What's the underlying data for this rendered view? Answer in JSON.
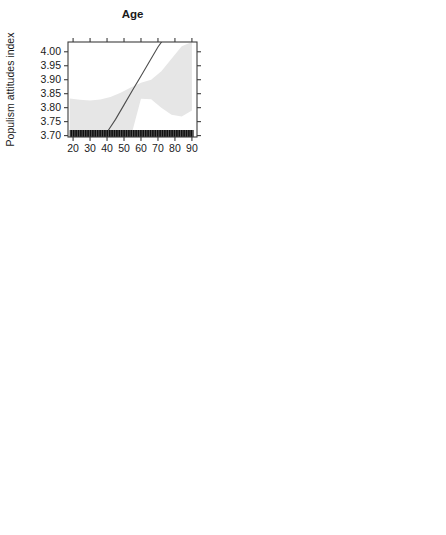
{
  "figure": {
    "ylabel": "Populism attitudes index",
    "y_ticks": [
      "4.00",
      "3.95",
      "3.90",
      "3.85",
      "3.80",
      "3.75",
      "3.70"
    ],
    "ylim": [
      3.695,
      4.035
    ],
    "band_color": "#e6e6e6",
    "line_color": "#4d4d4d",
    "rug_color": "#111111",
    "axis_color": "#3c3c3c"
  },
  "chart_data": [
    {
      "type": "line",
      "panel": 1,
      "title": "Age",
      "xlabel": "",
      "ylabel": "Populism attitudes index",
      "x_ticks": [
        "20",
        "30",
        "40",
        "50",
        "60",
        "70",
        "80",
        "90"
      ],
      "x_tick_values": [
        20,
        30,
        40,
        50,
        60,
        70,
        80,
        90
      ],
      "xlim": [
        17,
        93
      ],
      "ylim": [
        3.695,
        4.035
      ],
      "grid": false,
      "legend": "none",
      "series": [
        {
          "name": "Predicted populism attitudes",
          "x": [
            18,
            25,
            30,
            35,
            40,
            45,
            50,
            55,
            60,
            65,
            70,
            75
          ],
          "values": [
            3.6,
            3.635,
            3.66,
            3.685,
            3.712,
            3.758,
            3.81,
            3.862,
            3.913,
            3.965,
            4.017,
            4.06
          ]
        }
      ],
      "ci_upper": {
        "x": [
          18,
          24,
          30,
          36,
          42,
          48,
          54,
          60,
          66,
          72,
          78,
          84,
          90
        ],
        "values": [
          3.833,
          3.828,
          3.826,
          3.829,
          3.838,
          3.853,
          3.872,
          3.889,
          3.9,
          3.93,
          3.975,
          4.02,
          4.035
        ]
      },
      "ci_lower": {
        "x": [
          18,
          24,
          30,
          36,
          42,
          48,
          54,
          60,
          66,
          72,
          78,
          84,
          90
        ],
        "values": [
          3.695,
          3.695,
          3.695,
          3.695,
          3.695,
          3.695,
          3.695,
          3.832,
          3.83,
          3.8,
          3.775,
          3.768,
          3.79
        ]
      },
      "rug": {
        "type": "dense",
        "x_range": [
          18,
          91
        ],
        "description": "dense continuous rug of observations along bottom axis"
      }
    },
    {
      "type": "scatter",
      "panel": 2,
      "title": "Ideological self-placement",
      "xlabel": "",
      "ylabel": "Populism attitudes index",
      "categories": [
        "Centrist",
        "Moderate",
        "Extremist"
      ],
      "values": [
        3.804,
        3.807,
        3.894
      ],
      "ci_lower": [
        3.756,
        3.759,
        3.831
      ],
      "ci_upper": [
        3.852,
        3.855,
        3.956
      ],
      "ylim": [
        3.695,
        4.035
      ],
      "grid": false,
      "legend": "none"
    },
    {
      "type": "line",
      "panel": 3,
      "title": "Interest in politics",
      "xlabel": "",
      "ylabel": "Populism attitudes index",
      "x_ticks": [
        "1.0",
        "1.5",
        "2.0",
        "2.5",
        "3.0",
        "3.5",
        "4.0"
      ],
      "x_tick_values": [
        1.0,
        1.5,
        2.0,
        2.5,
        3.0,
        3.5,
        4.0
      ],
      "xlim": [
        0.9,
        4.1
      ],
      "ylim": [
        3.695,
        4.035
      ],
      "grid": false,
      "legend": "none",
      "series": [
        {
          "name": "Predicted populism attitudes",
          "x": [
            1.0,
            4.0
          ],
          "values": [
            3.767,
            3.889
          ]
        }
      ],
      "ci_upper": {
        "x": [
          1.0,
          2.0,
          3.0,
          4.0
        ],
        "values": [
          3.801,
          3.834,
          3.879,
          3.936
        ]
      },
      "ci_lower": {
        "x": [
          1.0,
          2.0,
          3.0,
          4.0
        ],
        "values": [
          3.733,
          3.777,
          3.815,
          3.845
        ]
      },
      "rug": {
        "type": "blocks",
        "x_values": [
          1.0,
          2.0,
          3.0,
          4.0
        ]
      }
    },
    {
      "type": "line",
      "panel": 4,
      "title": "Government appraisal",
      "xlabel": "",
      "ylabel": "Populism attitudes index",
      "x_ticks": [
        "1.0",
        "1.5",
        "2.0",
        "2.5",
        "3.0",
        "3.5",
        "4.0"
      ],
      "x_tick_values": [
        1.0,
        1.5,
        2.0,
        2.5,
        3.0,
        3.5,
        4.0
      ],
      "xlim": [
        0.9,
        4.1
      ],
      "ylim": [
        3.695,
        4.035
      ],
      "grid": false,
      "legend": "none",
      "series": [
        {
          "name": "Predicted populism attitudes",
          "x": [
            1.0,
            4.0
          ],
          "values": [
            3.938,
            3.714
          ]
        }
      ],
      "ci_upper": {
        "x": [
          1.0,
          2.0,
          3.0,
          4.0
        ],
        "values": [
          4.001,
          3.905,
          3.826,
          3.766
        ]
      },
      "ci_lower": {
        "x": [
          1.0,
          2.0,
          3.0,
          4.0
        ],
        "values": [
          3.878,
          3.83,
          3.762,
          3.695
        ]
      },
      "rug": {
        "type": "blocks",
        "x_values": [
          1.0,
          2.0,
          3.0,
          4.0
        ]
      }
    },
    {
      "type": "scatter",
      "panel": 5,
      "title": "Identifies with a party",
      "xlabel": "",
      "ylabel": "Populism attitudes index",
      "categories": [
        "no",
        "yes"
      ],
      "values": [
        3.858,
        3.787
      ],
      "ci_lower": [
        3.823,
        3.748
      ],
      "ci_upper": [
        3.895,
        3.822
      ],
      "ylim": [
        3.695,
        4.035
      ],
      "grid": false,
      "legend": "none"
    },
    {
      "type": "line",
      "panel": 6,
      "title": "Satisfaction with EU democracy",
      "xlabel": "",
      "ylabel": "Populism attitudes index",
      "x_ticks": [
        "1.0",
        "1.5",
        "2.0",
        "2.5",
        "3.0",
        "3.5",
        "4.0"
      ],
      "x_tick_values": [
        1.0,
        1.5,
        2.0,
        2.5,
        3.0,
        3.5,
        4.0
      ],
      "xlim": [
        0.9,
        4.1
      ],
      "ylim": [
        3.695,
        4.035
      ],
      "grid": false,
      "legend": "none",
      "series": [
        {
          "name": "Predicted populism attitudes",
          "x": [
            1.0,
            4.0
          ],
          "values": [
            3.9,
            3.718
          ]
        }
      ],
      "ci_upper": {
        "x": [
          1.0,
          2.0,
          3.0,
          4.0
        ],
        "values": [
          3.962,
          3.882,
          3.827,
          3.807
        ]
      },
      "ci_lower": {
        "x": [
          1.0,
          2.0,
          3.0,
          4.0
        ],
        "values": [
          3.838,
          3.795,
          3.74,
          3.695
        ]
      },
      "rug": {
        "type": "blocks",
        "x_values": [
          1.0,
          2.0,
          3.0,
          4.0
        ]
      }
    }
  ]
}
